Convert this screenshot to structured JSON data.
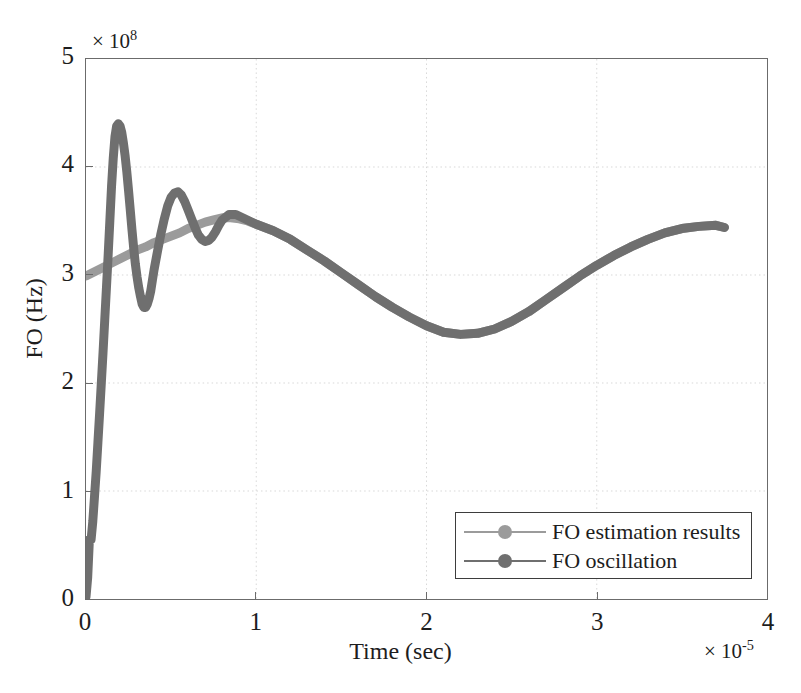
{
  "chart_data": {
    "type": "line",
    "title": "",
    "xlabel": "Time (sec)",
    "ylabel": "FO (Hz)",
    "x_exponent_label": "× 10",
    "x_exponent_value": "-5",
    "y_exponent_label": "× 10",
    "y_exponent_value": "8",
    "xlim": [
      0,
      4
    ],
    "ylim": [
      0,
      5
    ],
    "xticks": [
      "0",
      "1",
      "2",
      "3",
      "4"
    ],
    "yticks": [
      "0",
      "1",
      "2",
      "3",
      "4",
      "5"
    ],
    "grid": true,
    "grid_style": "dotted",
    "grid_color": "#d8d8d8",
    "axis_color": "#6b6b6b",
    "legend_position": "bottom-right",
    "series": [
      {
        "name": "FO estimation results",
        "color": "#9b9b9b",
        "linewidth": 9,
        "marker": "circle",
        "points": [
          [
            0.0,
            2.99
          ],
          [
            0.05,
            3.03
          ],
          [
            0.1,
            3.07
          ],
          [
            0.15,
            3.11
          ],
          [
            0.2,
            3.15
          ],
          [
            0.25,
            3.19
          ],
          [
            0.3,
            3.23
          ],
          [
            0.35,
            3.26
          ],
          [
            0.4,
            3.3
          ],
          [
            0.45,
            3.33
          ],
          [
            0.5,
            3.36
          ],
          [
            0.55,
            3.39
          ],
          [
            0.6,
            3.43
          ],
          [
            0.65,
            3.46
          ],
          [
            0.7,
            3.49
          ],
          [
            0.75,
            3.51
          ],
          [
            0.8,
            3.53
          ],
          [
            0.85,
            3.53
          ],
          [
            0.9,
            3.52
          ],
          [
            0.95,
            3.5
          ],
          [
            1.0,
            3.47
          ],
          [
            1.1,
            3.41
          ],
          [
            1.2,
            3.33
          ],
          [
            1.3,
            3.23
          ],
          [
            1.4,
            3.13
          ],
          [
            1.5,
            3.02
          ],
          [
            1.6,
            2.91
          ],
          [
            1.7,
            2.8
          ],
          [
            1.8,
            2.7
          ],
          [
            1.9,
            2.61
          ],
          [
            2.0,
            2.53
          ],
          [
            2.1,
            2.47
          ],
          [
            2.2,
            2.45
          ],
          [
            2.3,
            2.46
          ],
          [
            2.4,
            2.5
          ],
          [
            2.5,
            2.57
          ],
          [
            2.6,
            2.66
          ],
          [
            2.7,
            2.77
          ],
          [
            2.8,
            2.88
          ],
          [
            2.9,
            2.99
          ],
          [
            3.0,
            3.09
          ],
          [
            3.1,
            3.18
          ],
          [
            3.2,
            3.26
          ],
          [
            3.3,
            3.33
          ],
          [
            3.4,
            3.39
          ],
          [
            3.5,
            3.43
          ],
          [
            3.6,
            3.45
          ],
          [
            3.7,
            3.46
          ],
          [
            3.75,
            3.44
          ]
        ]
      },
      {
        "name": "FO oscillation",
        "color": "#6f6f6f",
        "linewidth": 9,
        "marker": "circle",
        "points": [
          [
            0.0,
            0.02
          ],
          [
            0.01,
            0.2
          ],
          [
            0.02,
            0.55
          ],
          [
            0.03,
            0.55
          ],
          [
            0.04,
            0.72
          ],
          [
            0.05,
            0.95
          ],
          [
            0.06,
            1.18
          ],
          [
            0.07,
            1.45
          ],
          [
            0.08,
            1.72
          ],
          [
            0.09,
            2.0
          ],
          [
            0.1,
            2.28
          ],
          [
            0.11,
            2.58
          ],
          [
            0.12,
            2.88
          ],
          [
            0.13,
            3.18
          ],
          [
            0.14,
            3.5
          ],
          [
            0.15,
            3.82
          ],
          [
            0.16,
            4.08
          ],
          [
            0.17,
            4.28
          ],
          [
            0.18,
            4.38
          ],
          [
            0.19,
            4.4
          ],
          [
            0.2,
            4.38
          ],
          [
            0.21,
            4.32
          ],
          [
            0.22,
            4.22
          ],
          [
            0.23,
            4.1
          ],
          [
            0.24,
            3.95
          ],
          [
            0.25,
            3.78
          ],
          [
            0.26,
            3.6
          ],
          [
            0.27,
            3.42
          ],
          [
            0.28,
            3.25
          ],
          [
            0.29,
            3.1
          ],
          [
            0.3,
            2.98
          ],
          [
            0.31,
            2.88
          ],
          [
            0.32,
            2.8
          ],
          [
            0.33,
            2.73
          ],
          [
            0.34,
            2.7
          ],
          [
            0.35,
            2.7
          ],
          [
            0.36,
            2.73
          ],
          [
            0.37,
            2.78
          ],
          [
            0.38,
            2.85
          ],
          [
            0.39,
            2.95
          ],
          [
            0.4,
            3.05
          ],
          [
            0.42,
            3.22
          ],
          [
            0.44,
            3.38
          ],
          [
            0.46,
            3.52
          ],
          [
            0.48,
            3.64
          ],
          [
            0.5,
            3.72
          ],
          [
            0.52,
            3.76
          ],
          [
            0.54,
            3.77
          ],
          [
            0.56,
            3.74
          ],
          [
            0.58,
            3.68
          ],
          [
            0.6,
            3.6
          ],
          [
            0.62,
            3.52
          ],
          [
            0.64,
            3.44
          ],
          [
            0.66,
            3.37
          ],
          [
            0.68,
            3.33
          ],
          [
            0.7,
            3.31
          ],
          [
            0.72,
            3.32
          ],
          [
            0.74,
            3.35
          ],
          [
            0.76,
            3.4
          ],
          [
            0.78,
            3.46
          ],
          [
            0.8,
            3.51
          ],
          [
            0.84,
            3.56
          ],
          [
            0.88,
            3.56
          ],
          [
            0.92,
            3.53
          ],
          [
            0.96,
            3.5
          ],
          [
            1.0,
            3.47
          ],
          [
            1.1,
            3.41
          ],
          [
            1.2,
            3.33
          ],
          [
            1.3,
            3.23
          ],
          [
            1.4,
            3.13
          ],
          [
            1.5,
            3.02
          ],
          [
            1.6,
            2.91
          ],
          [
            1.7,
            2.8
          ],
          [
            1.8,
            2.7
          ],
          [
            1.9,
            2.61
          ],
          [
            2.0,
            2.53
          ],
          [
            2.1,
            2.47
          ],
          [
            2.2,
            2.45
          ],
          [
            2.3,
            2.46
          ],
          [
            2.4,
            2.5
          ],
          [
            2.5,
            2.57
          ],
          [
            2.6,
            2.66
          ],
          [
            2.7,
            2.77
          ],
          [
            2.8,
            2.88
          ],
          [
            2.9,
            2.99
          ],
          [
            3.0,
            3.09
          ],
          [
            3.1,
            3.18
          ],
          [
            3.2,
            3.26
          ],
          [
            3.3,
            3.33
          ],
          [
            3.4,
            3.39
          ],
          [
            3.5,
            3.43
          ],
          [
            3.6,
            3.45
          ],
          [
            3.7,
            3.46
          ],
          [
            3.75,
            3.44
          ]
        ]
      }
    ]
  },
  "legend": {
    "items": [
      {
        "label": "FO estimation results",
        "color": "#9b9b9b"
      },
      {
        "label": "FO oscillation",
        "color": "#6f6f6f"
      }
    ]
  }
}
